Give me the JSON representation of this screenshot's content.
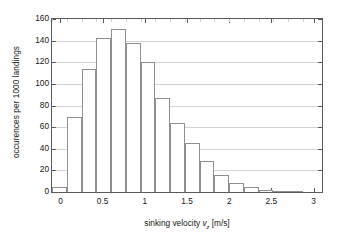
{
  "chart_data": {
    "type": "bar",
    "title": "",
    "subtitle": "",
    "xlabel_prefix": "sinking velocity ",
    "xlabel_var": "v",
    "xlabel_sub": "z",
    "xlabel_units": " [m/s]",
    "xlabel_full": "sinking velocity v_z [m/s]",
    "ylabel": "occurences per 1000 landings",
    "xlim": [
      -0.1,
      3.1
    ],
    "ylim": [
      0,
      160
    ],
    "grid": true,
    "grid_axis": "y",
    "legend": "none",
    "bin_width": 0.175,
    "bin_starts": [
      -0.1,
      0.075,
      0.25,
      0.425,
      0.6,
      0.775,
      0.95,
      1.125,
      1.3,
      1.475,
      1.65,
      1.825,
      2.0,
      2.175,
      2.35,
      2.525,
      2.7,
      2.875
    ],
    "categories": [
      "-0.1–0.075",
      "0.075–0.25",
      "0.25–0.425",
      "0.425–0.6",
      "0.6–0.775",
      "0.775–0.95",
      "0.95–1.125",
      "1.125–1.3",
      "1.3–1.475",
      "1.475–1.65",
      "1.65–1.825",
      "1.825–2.0",
      "2.0–2.175",
      "2.175–2.35",
      "2.35–2.525",
      "2.525–2.7",
      "2.7–2.875",
      "2.875–3.05"
    ],
    "values": [
      5,
      69,
      114,
      142,
      151,
      138,
      120,
      87,
      64,
      45,
      29,
      16,
      8,
      5,
      2,
      1,
      0.5,
      0
    ],
    "xticks": [
      0,
      0.5,
      1,
      1.5,
      2,
      2.5,
      3
    ],
    "xtick_labels": [
      "0",
      "0.5",
      "1",
      "1.5",
      "2",
      "2.5",
      "3"
    ],
    "yticks": [
      0,
      20,
      40,
      60,
      80,
      100,
      120,
      140,
      160
    ],
    "ytick_labels": [
      "0",
      "20",
      "40",
      "60",
      "80",
      "100",
      "120",
      "140",
      "160"
    ],
    "bar_edge_color": "#8f8f8f",
    "bar_fill_color": "#ffffff",
    "grid_color": "#d2d2d2",
    "axis_color": "#5a5a5a",
    "text_color": "#141414",
    "background_color": "#ffffff"
  }
}
